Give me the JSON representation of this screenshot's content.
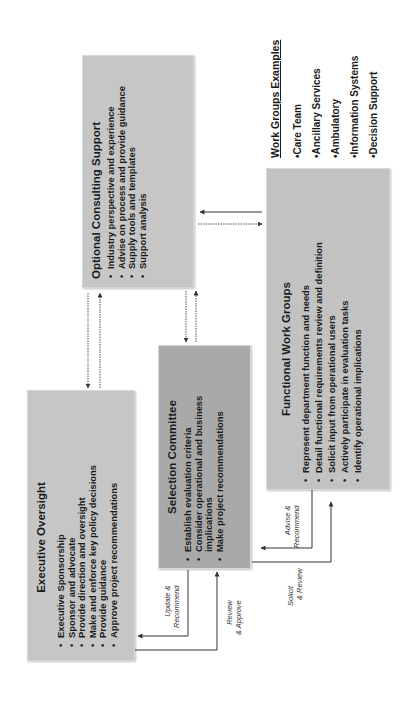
{
  "diagram": {
    "orientation": "rotated -90deg (text reads bottom-to-top)",
    "colors": {
      "box_light": "#c6c6c6",
      "box_medium": "#bfbfbf",
      "box_dark": "#a9a9a9",
      "arrow": "#333333"
    },
    "executive_oversight": {
      "title": "Executive Oversight",
      "bullets": [
        "Executive Sponsorship",
        "Sponsor and advocate",
        "Provide direction and oversight",
        "Make and enforce key policy decisions",
        "Provide guidance",
        "Approve project recommendations"
      ]
    },
    "optional_consulting_support": {
      "title": "Optional Consulting Support",
      "bullets": [
        "Industry perspective and experience",
        "Advise on process and provide guidance",
        "Supply tools and templates",
        "Support analysis"
      ]
    },
    "selection_committee": {
      "title": "Selection Committee",
      "bullets": [
        "Establish evaluation criteria",
        "Consider operational and business implications",
        "Make project recommendations"
      ]
    },
    "functional_work_groups": {
      "title": "Functional Work Groups",
      "bullets": [
        "Represent department function and needs",
        "Detail functional requirements review and definition",
        "Solicit input from operational users",
        "Actively participate in evaluation tasks",
        "Identify operational implications"
      ]
    },
    "work_groups_examples": {
      "title": "Work Groups Examples",
      "items": [
        "•Care Team",
        "•Ancillary Services",
        "•Ambulatory",
        "•Information Systems",
        "•Decision Support"
      ]
    },
    "connector_labels": {
      "update_recommend": [
        "Update &",
        "Recommend"
      ],
      "review_approve": [
        "Review",
        "& Approve"
      ],
      "advise_recommend": [
        "Advise &",
        "Recommend"
      ],
      "solicit_review": [
        "Solicit",
        "& Review"
      ]
    }
  }
}
